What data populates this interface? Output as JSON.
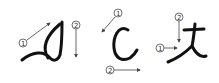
{
  "diagram": {
    "type": "stroke-order",
    "colors": {
      "stroke": "#111111",
      "arrow": "#444444",
      "label": "#333333"
    },
    "characters": [
      {
        "id": "char-1",
        "strokes": [
          {
            "order": "1",
            "label": "①",
            "direction": "up-right"
          },
          {
            "order": "2",
            "label": "②",
            "direction": "down"
          }
        ]
      },
      {
        "id": "char-2",
        "strokes": [
          {
            "order": "1",
            "label": "①",
            "direction": "down-left"
          },
          {
            "order": "2",
            "label": "②",
            "direction": "right"
          }
        ]
      },
      {
        "id": "char-3",
        "strokes": [
          {
            "order": "1",
            "label": "①",
            "direction": "right"
          },
          {
            "order": "2",
            "label": "②",
            "direction": "down"
          }
        ]
      }
    ]
  }
}
